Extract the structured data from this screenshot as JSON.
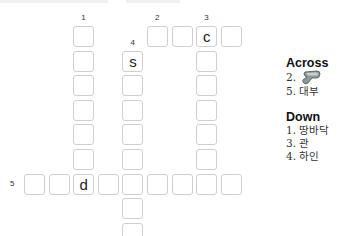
{
  "puzzle": {
    "cell_size": 21,
    "pitch": 24.6,
    "origin_x": 24,
    "origin_y": 26,
    "numbers": [
      {
        "label": "1",
        "col": 2,
        "row": 0
      },
      {
        "label": "2",
        "col": 5,
        "row": 0
      },
      {
        "label": "3",
        "col": 7,
        "row": 0
      },
      {
        "label": "4",
        "col": 4,
        "row": 1
      },
      {
        "label": "5",
        "col": 0,
        "row": 6
      }
    ],
    "cells": [
      {
        "col": 2,
        "row": 0,
        "letter": ""
      },
      {
        "col": 2,
        "row": 1,
        "letter": ""
      },
      {
        "col": 2,
        "row": 2,
        "letter": ""
      },
      {
        "col": 2,
        "row": 3,
        "letter": ""
      },
      {
        "col": 2,
        "row": 4,
        "letter": ""
      },
      {
        "col": 2,
        "row": 5,
        "letter": ""
      },
      {
        "col": 5,
        "row": 0,
        "letter": ""
      },
      {
        "col": 6,
        "row": 0,
        "letter": ""
      },
      {
        "col": 7,
        "row": 0,
        "letter": "c"
      },
      {
        "col": 8,
        "row": 0,
        "letter": ""
      },
      {
        "col": 7,
        "row": 1,
        "letter": ""
      },
      {
        "col": 7,
        "row": 2,
        "letter": ""
      },
      {
        "col": 7,
        "row": 3,
        "letter": ""
      },
      {
        "col": 7,
        "row": 4,
        "letter": ""
      },
      {
        "col": 7,
        "row": 5,
        "letter": ""
      },
      {
        "col": 4,
        "row": 1,
        "letter": "s"
      },
      {
        "col": 4,
        "row": 2,
        "letter": ""
      },
      {
        "col": 4,
        "row": 3,
        "letter": ""
      },
      {
        "col": 4,
        "row": 4,
        "letter": ""
      },
      {
        "col": 4,
        "row": 5,
        "letter": ""
      },
      {
        "col": 4,
        "row": 7,
        "letter": ""
      },
      {
        "col": 4,
        "row": 8,
        "letter": ""
      },
      {
        "col": 0,
        "row": 6,
        "letter": ""
      },
      {
        "col": 1,
        "row": 6,
        "letter": ""
      },
      {
        "col": 2,
        "row": 6,
        "letter": "d"
      },
      {
        "col": 3,
        "row": 6,
        "letter": ""
      },
      {
        "col": 4,
        "row": 6,
        "letter": ""
      },
      {
        "col": 5,
        "row": 6,
        "letter": ""
      },
      {
        "col": 6,
        "row": 6,
        "letter": ""
      },
      {
        "col": 7,
        "row": 6,
        "letter": ""
      },
      {
        "col": 8,
        "row": 6,
        "letter": ""
      }
    ]
  },
  "clues": {
    "across_title": "Across",
    "across": [
      {
        "number": "2.",
        "text": "",
        "icon": "hammer-icon"
      },
      {
        "number": "5.",
        "text": "대부"
      }
    ],
    "down_title": "Down",
    "down": [
      {
        "number": "1.",
        "text": "땅바닥"
      },
      {
        "number": "3.",
        "text": "관"
      },
      {
        "number": "4.",
        "text": "하인"
      }
    ]
  }
}
